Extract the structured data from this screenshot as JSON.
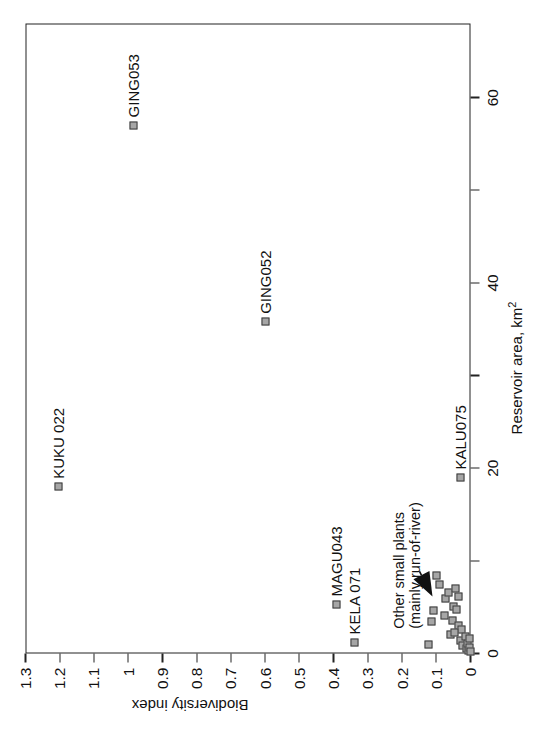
{
  "chart_data": {
    "type": "scatter",
    "title": "",
    "xlabel": "Reservoir area, km 2",
    "xlabel_base": "Reservoir area, km",
    "xlabel_sup": "2",
    "ylabel": "Biodiversity index",
    "xlim": [
      0,
      68
    ],
    "ylim": [
      0,
      1.3
    ],
    "grid": false,
    "legend": "none",
    "xticks": [
      0,
      10,
      20,
      30,
      40,
      50,
      60
    ],
    "xtick_labels": [
      "0",
      "",
      "20",
      "",
      "40",
      "",
      "60"
    ],
    "yticks": [
      0,
      0.1,
      0.2,
      0.3,
      0.4,
      0.5,
      0.6,
      0.7,
      0.8,
      0.9,
      1.0,
      1.1,
      1.2,
      1.3
    ],
    "ytick_labels": [
      "0",
      "0.1",
      "0.2",
      "0.3",
      "0.4",
      "0.5",
      "0.6",
      "0.7",
      "0.8",
      "0.9",
      "1",
      "1.1",
      "1.2",
      "1.3"
    ],
    "points": [
      {
        "name": "KUKU 022",
        "x": 18.0,
        "y": 1.205,
        "labeled": true,
        "label_side": "right"
      },
      {
        "name": "GING053",
        "x": 57.0,
        "y": 0.985,
        "labeled": true,
        "label_side": "right"
      },
      {
        "name": "GING052",
        "x": 35.8,
        "y": 0.6,
        "labeled": true,
        "label_side": "right"
      },
      {
        "name": "MAGU043",
        "x": 5.3,
        "y": 0.392,
        "labeled": true,
        "label_side": "right"
      },
      {
        "name": "KELA 071",
        "x": 1.2,
        "y": 0.338,
        "labeled": true,
        "label_side": "right"
      },
      {
        "name": "KALU075",
        "x": 19.0,
        "y": 0.028,
        "labeled": true,
        "label_side": "right"
      },
      {
        "name": "p07",
        "x": 1.0,
        "y": 0.122,
        "labeled": false
      },
      {
        "name": "p08",
        "x": 3.4,
        "y": 0.113,
        "labeled": false
      },
      {
        "name": "p09",
        "x": 4.6,
        "y": 0.108,
        "labeled": false
      },
      {
        "name": "p10",
        "x": 7.4,
        "y": 0.092,
        "labeled": false
      },
      {
        "name": "p11",
        "x": 8.4,
        "y": 0.098,
        "labeled": false
      },
      {
        "name": "p12",
        "x": 4.1,
        "y": 0.076,
        "labeled": false
      },
      {
        "name": "p13",
        "x": 5.9,
        "y": 0.074,
        "labeled": false
      },
      {
        "name": "p14",
        "x": 6.6,
        "y": 0.064,
        "labeled": false
      },
      {
        "name": "p15",
        "x": 2.1,
        "y": 0.058,
        "labeled": false
      },
      {
        "name": "p16",
        "x": 3.6,
        "y": 0.052,
        "labeled": false
      },
      {
        "name": "p17",
        "x": 5.1,
        "y": 0.05,
        "labeled": false
      },
      {
        "name": "p18",
        "x": 4.8,
        "y": 0.04,
        "labeled": false
      },
      {
        "name": "p19",
        "x": 3.0,
        "y": 0.036,
        "labeled": false
      },
      {
        "name": "p20",
        "x": 1.4,
        "y": 0.03,
        "labeled": false
      },
      {
        "name": "p21",
        "x": 2.6,
        "y": 0.026,
        "labeled": false
      },
      {
        "name": "p22",
        "x": 0.9,
        "y": 0.022,
        "labeled": false
      },
      {
        "name": "p23",
        "x": 1.8,
        "y": 0.016,
        "labeled": false
      },
      {
        "name": "p24",
        "x": 0.5,
        "y": 0.012,
        "labeled": false
      },
      {
        "name": "p25",
        "x": 1.1,
        "y": 0.008,
        "labeled": false
      },
      {
        "name": "p26",
        "x": 0.3,
        "y": 0.005,
        "labeled": false
      },
      {
        "name": "p27",
        "x": 0.7,
        "y": 0.003,
        "labeled": false
      },
      {
        "name": "p28",
        "x": 1.6,
        "y": 0.002,
        "labeled": false
      },
      {
        "name": "p29",
        "x": 0.2,
        "y": 0.001,
        "labeled": false
      },
      {
        "name": "p30",
        "x": 2.3,
        "y": 0.046,
        "labeled": false
      },
      {
        "name": "p31",
        "x": 6.1,
        "y": 0.034,
        "labeled": false
      },
      {
        "name": "p32",
        "x": 7.0,
        "y": 0.044,
        "labeled": false
      }
    ],
    "annotations": [
      {
        "id": "other-small-plants",
        "line1": "Other small plants",
        "line2": "(mainly run-of-river)",
        "arrow": true,
        "text_x": 9.5,
        "text_y": 0.175,
        "arrow_from_x": 8.9,
        "arrow_from_y": 0.15,
        "arrow_to_x": 6.2,
        "arrow_to_y": 0.112
      }
    ]
  },
  "colors": {
    "marker_fill": "#a6a6a6",
    "marker_stroke": "#3b3b3b",
    "axis": "#222222",
    "text": "#111111",
    "background": "#ffffff"
  }
}
